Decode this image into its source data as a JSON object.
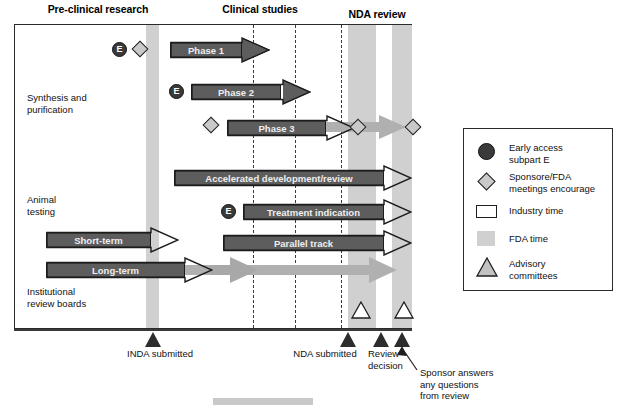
{
  "diagram": {
    "columns": [
      {
        "id": "pre-clinical",
        "label": "Pre-clinical\nresearch"
      },
      {
        "id": "clinical",
        "label": "Clinical\nstudies"
      },
      {
        "id": "nda-review",
        "label": "NDA review"
      }
    ],
    "rows": [
      {
        "id": "synthesis",
        "label": "Synthesis and\npurification"
      },
      {
        "id": "animal",
        "label": "Animal\ntesting"
      },
      {
        "id": "irb",
        "label": "Institutional\nreview boards"
      }
    ],
    "arrows": [
      {
        "id": "phase-1",
        "label": "Phase 1",
        "style": "dark"
      },
      {
        "id": "phase-2",
        "label": "Phase 2",
        "style": "dark"
      },
      {
        "id": "phase-3",
        "label": "Phase 3",
        "style": "dark"
      },
      {
        "id": "phase-3-ext",
        "label": "",
        "style": "light"
      },
      {
        "id": "accelerated",
        "label": "Accelerated development/review",
        "style": "dark"
      },
      {
        "id": "treatment",
        "label": "Treatment indication",
        "style": "dark"
      },
      {
        "id": "short-term",
        "label": "Short-term",
        "style": "dark"
      },
      {
        "id": "parallel",
        "label": "Parallel track",
        "style": "dark"
      },
      {
        "id": "long-term",
        "label": "Long-term",
        "style": "dark"
      },
      {
        "id": "long-term-ext",
        "label": "",
        "style": "light"
      }
    ],
    "early_access_badges": [
      {
        "id": "e-badge-1",
        "label": "E"
      },
      {
        "id": "e-badge-2",
        "label": "E"
      },
      {
        "id": "e-badge-3",
        "label": "E"
      }
    ],
    "axis_markers": [
      {
        "id": "inda-submitted",
        "label": "INDA submitted"
      },
      {
        "id": "nda-submitted",
        "label": "NDA submitted"
      },
      {
        "id": "review-decision",
        "label": "Review\ndecision"
      },
      {
        "id": "sponsor-answers",
        "label": "Sponsor answers\nany questions\nfrom review"
      }
    ]
  },
  "legend": {
    "items": [
      {
        "id": "early-access",
        "icon": "filled-circle",
        "label": "Early access\nsubpart E"
      },
      {
        "id": "sponsor-fda-meetings",
        "icon": "diamond",
        "label": "Sponsore/FDA\nmeetings encourage"
      },
      {
        "id": "industry-time",
        "icon": "open-rectangle",
        "label": "Industry time"
      },
      {
        "id": "fda-time",
        "icon": "gray-band",
        "label": "FDA time"
      },
      {
        "id": "advisory-committees",
        "icon": "open-triangle",
        "label": "Advisory\ncommittees"
      }
    ]
  },
  "colors": {
    "fda_band": "#d0d0d0",
    "dark_arrow": "#5d5d5d",
    "light_arrow": "#b4b4b4",
    "outline": "#1c1c1c",
    "marker_fill": "#2d2d2d",
    "diamond_fill": "#c9c9c9"
  }
}
